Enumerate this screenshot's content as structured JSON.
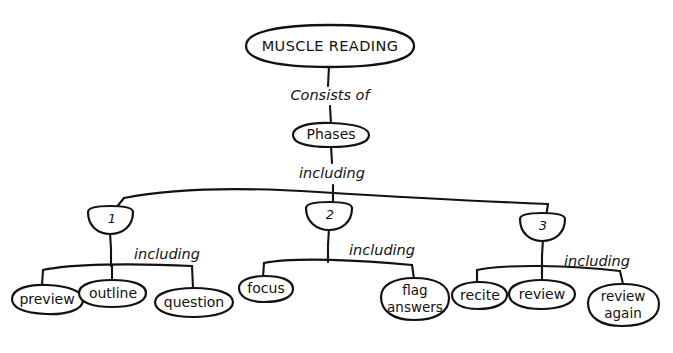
{
  "diagram": {
    "title": "MUSCLE READING",
    "background_color": "#ffffff",
    "ink_color": "#121212",
    "style": "hand-drawn concept map"
  },
  "nodes": {
    "root": {
      "label": "MUSCLE READING"
    },
    "phases": {
      "label": "Phases"
    },
    "phase1": {
      "label": "1"
    },
    "phase2": {
      "label": "2"
    },
    "phase3": {
      "label": "3"
    },
    "preview": {
      "label": "preview"
    },
    "outline": {
      "label": "outline"
    },
    "question": {
      "label": "question"
    },
    "focus": {
      "label": "focus"
    },
    "flag_answers_line1": {
      "label": "flag"
    },
    "flag_answers_line2": {
      "label": "answers"
    },
    "recite": {
      "label": "recite"
    },
    "review": {
      "label": "review"
    },
    "review_again_line1": {
      "label": "review"
    },
    "review_again_line2": {
      "label": "again"
    }
  },
  "links": {
    "consists_of": {
      "label": "Consists of"
    },
    "including_phases": {
      "label": "including"
    },
    "including_1": {
      "label": "including"
    },
    "including_2": {
      "label": "including"
    },
    "including_3": {
      "label": "including"
    }
  },
  "footnote": {
    "text": ""
  }
}
